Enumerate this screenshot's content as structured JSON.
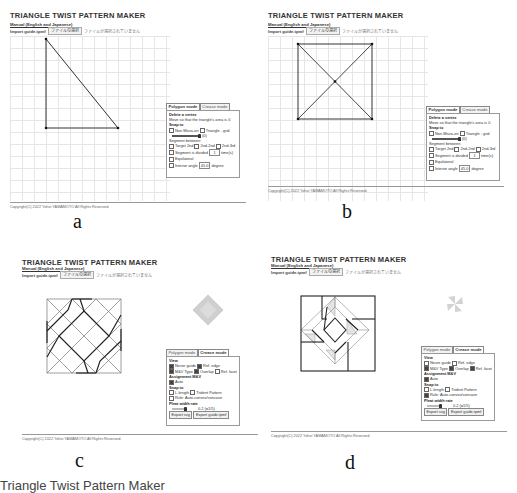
{
  "app": {
    "title": "TRIANGLE TWIST PATTERN MAKER",
    "manual_link": "Manual (English and Japanese)",
    "import_label": "Import guide.tpmf",
    "file_button": "ファイルの選択",
    "file_status": "ファイルが選択されていません",
    "copyright": "Copyright(C) 2022 Yohei YAMAMOTO All Rights Reserved."
  },
  "tabs": {
    "polygon": "Polygon mode",
    "crease": "Crease mode"
  },
  "polygon_panel": {
    "delete_vertex": "Delete a vertex",
    "move_hint": "Move so that the triangle's area is 0",
    "snap_to": "Snap to",
    "snap_nonmiura": "Non Miura-ori",
    "snap_triangle_grid": "Triangle - grid",
    "slider_value": "(0)",
    "segment_between": "Segment between",
    "target_2nd": "Target 2nd",
    "2nd_2nd": "2nd-2nd",
    "2nd_3rd": "2nd-3rd",
    "segment_divided": "Segment is divided",
    "divided_value": "1",
    "times": "time(s)",
    "equilateral": "Equilateral",
    "interior_angle": "Interior angle",
    "angle_value": "45.0",
    "degree": "degree"
  },
  "crease_panel": {
    "view": "View",
    "never_guide": "Never guide",
    "ref_edge": "Ref. edge",
    "mv_type": "M&V Type",
    "overlap": "Overlap",
    "ref_facet": "Ref. facet",
    "assignment": "Assignment M&V",
    "auto": "Auto",
    "snap_to": "Snap to",
    "length": "L-length",
    "trident": "Trident Pattern",
    "rule": "Rule: Auto-convex/concave",
    "pleat_width": "Pleat width rate",
    "pleat_value": "0.2 (=1/5)",
    "export_svg": "Export svg",
    "export_guide": "Export guide.tpmf"
  },
  "panels": [
    {
      "id": "a",
      "caption": "a",
      "mode": "polygon",
      "pattern": "right-triangle"
    },
    {
      "id": "b",
      "caption": "b",
      "mode": "polygon",
      "pattern": "square-with-diagonals"
    },
    {
      "id": "c",
      "caption": "c",
      "mode": "crease",
      "pattern": "square-twist-crease-pattern"
    },
    {
      "id": "d",
      "caption": "d",
      "mode": "crease",
      "pattern": "square-twist-with-overlap-facets"
    }
  ],
  "captions": {
    "a": "a",
    "b": "b",
    "c": "c",
    "d": "d"
  },
  "figure_caption_partial": "Triangle Twist Pattern Maker"
}
